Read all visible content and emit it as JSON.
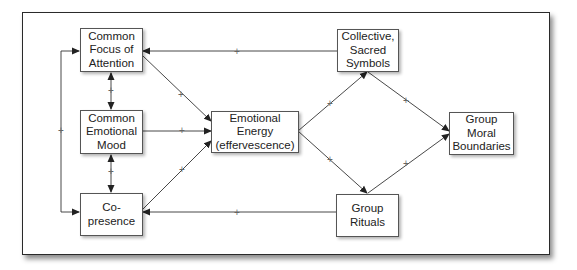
{
  "diagram": {
    "nodes": [
      {
        "id": "focus",
        "label": "Common\nFocus of\nAttention"
      },
      {
        "id": "mood",
        "label": "Common\nEmotional\nMood"
      },
      {
        "id": "copresence",
        "label": "Co-\npresence"
      },
      {
        "id": "energy",
        "label": "Emotional\nEnergy\n(effervescence)"
      },
      {
        "id": "symbols",
        "label": "Collective,\nSacred\nSymbols"
      },
      {
        "id": "boundaries",
        "label": "Group\nMoral\nBoundaries"
      },
      {
        "id": "rituals",
        "label": "Group\nRituals"
      }
    ],
    "edges": [
      {
        "from": "symbols",
        "to": "focus",
        "sign": "+"
      },
      {
        "from": "focus",
        "to": "energy",
        "sign": "+"
      },
      {
        "from": "mood",
        "to": "energy",
        "sign": "+"
      },
      {
        "from": "copresence",
        "to": "energy",
        "sign": "+"
      },
      {
        "from": "focus",
        "to": "mood",
        "sign": "+",
        "bidirectional": true
      },
      {
        "from": "mood",
        "to": "copresence",
        "sign": "+",
        "bidirectional": true
      },
      {
        "from": "copresence",
        "to": "focus",
        "sign": "+",
        "bidirectional": true
      },
      {
        "from": "energy",
        "to": "symbols",
        "sign": "+"
      },
      {
        "from": "energy",
        "to": "rituals",
        "sign": "+"
      },
      {
        "from": "symbols",
        "to": "boundaries",
        "sign": "+"
      },
      {
        "from": "rituals",
        "to": "boundaries",
        "sign": "+"
      },
      {
        "from": "rituals",
        "to": "copresence",
        "sign": "+"
      }
    ],
    "sign_label": "+",
    "colors": {
      "line": "#333333",
      "border": "#555555",
      "text": "#222222"
    }
  }
}
